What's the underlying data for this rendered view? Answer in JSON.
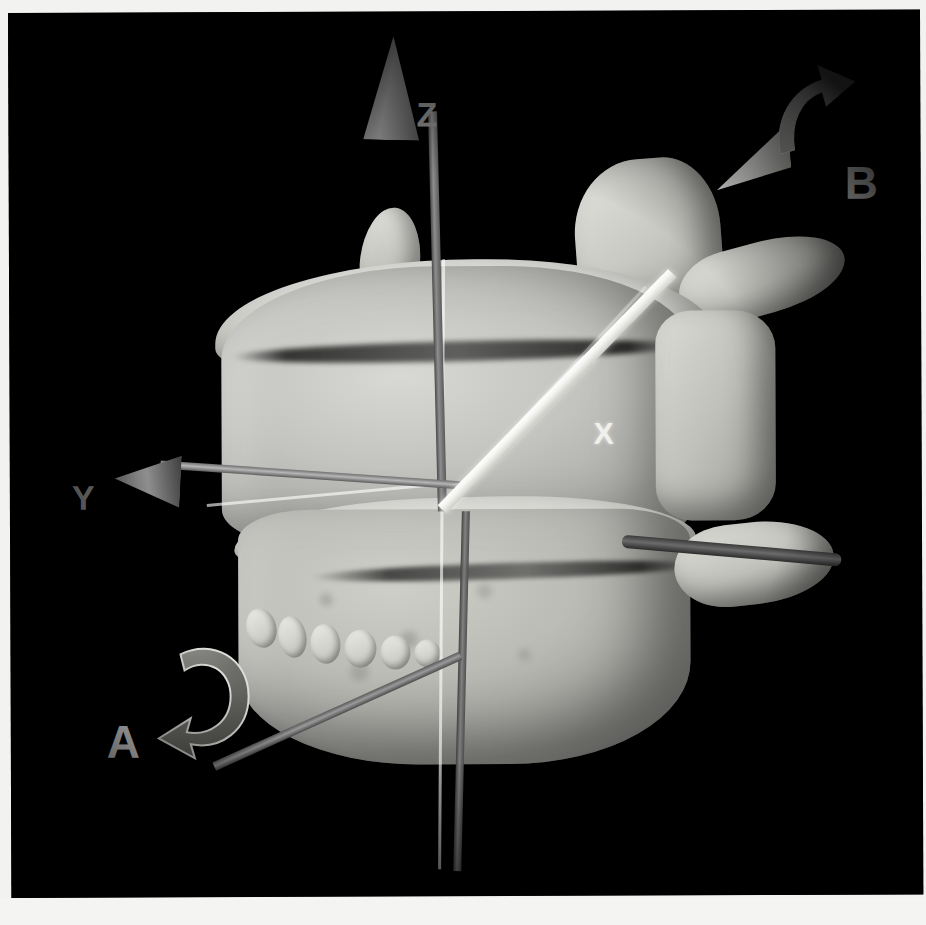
{
  "figure": {
    "kind": "3d-ct-surface-rendering",
    "background_color": "#000000",
    "page_color": "#f4f4f2",
    "bone_color": "#c6c6c1"
  },
  "axes": {
    "z": {
      "label": "Z",
      "label_color": "#8b8b8b",
      "direction": "superior (up)",
      "style": "dark-gray shaft with cone arrowhead"
    },
    "y": {
      "label": "Y",
      "label_color": "#6e6e6e",
      "direction": "left / lateral",
      "style": "dark-gray shaft with cone arrowhead"
    },
    "x": {
      "label": "X",
      "label_color": "#f0f0ec",
      "direction": "anterior-oblique (up-right)",
      "style": "bright white beam with cone arrowhead"
    }
  },
  "rotation_markers": [
    {
      "id": "A",
      "label": "A",
      "label_color": "#ffffff",
      "description": "curved rotation arrow about the lower-left axis",
      "position": "lower-left"
    },
    {
      "id": "B",
      "label": "B",
      "label_color": "#ffffff",
      "description": "curved rotation arrow about the white X axis",
      "position": "upper-right"
    }
  ],
  "labels": {
    "z": "Z",
    "y": "Y",
    "x": "X",
    "a": "A",
    "b": "B"
  }
}
